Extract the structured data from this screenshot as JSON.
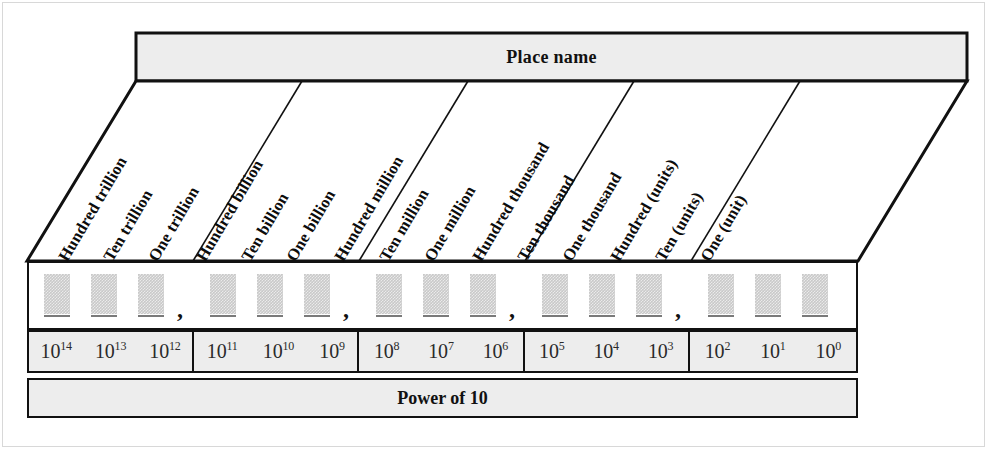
{
  "header": {
    "title": "Place name"
  },
  "footer": {
    "title": "Power of 10"
  },
  "colors": {
    "header_fill": "#ededed",
    "digit_box_fill": "#c9c9c9",
    "digit_underline": "#7a7a7a",
    "outline": "#111111",
    "page_background": "#ffffff"
  },
  "place_labels": [
    "Hundred trillion",
    "Ten trillion",
    "One trillion",
    "Hundred billion",
    "Ten billion",
    "One billion",
    "Hundred million",
    "Ten million",
    "One million",
    "Hundred thousand",
    "Ten thousand",
    "One thousand",
    "Hundred (units)",
    "Ten (units)",
    "One (unit)"
  ],
  "separator": ",",
  "digit_groups": [
    {
      "name": "trillions",
      "cells": [
        "",
        "",
        ""
      ]
    },
    {
      "name": "billions",
      "cells": [
        "",
        "",
        ""
      ]
    },
    {
      "name": "millions",
      "cells": [
        "",
        "",
        ""
      ]
    },
    {
      "name": "thousands",
      "cells": [
        "",
        "",
        ""
      ]
    },
    {
      "name": "units",
      "cells": [
        "",
        "",
        ""
      ]
    }
  ],
  "exponent_groups": [
    {
      "name": "trillions",
      "cells": [
        {
          "base": "10",
          "exp": "14"
        },
        {
          "base": "10",
          "exp": "13"
        },
        {
          "base": "10",
          "exp": "12"
        }
      ]
    },
    {
      "name": "billions",
      "cells": [
        {
          "base": "10",
          "exp": "11"
        },
        {
          "base": "10",
          "exp": "10"
        },
        {
          "base": "10",
          "exp": "9"
        }
      ]
    },
    {
      "name": "millions",
      "cells": [
        {
          "base": "10",
          "exp": "8"
        },
        {
          "base": "10",
          "exp": "7"
        },
        {
          "base": "10",
          "exp": "6"
        }
      ]
    },
    {
      "name": "thousands",
      "cells": [
        {
          "base": "10",
          "exp": "5"
        },
        {
          "base": "10",
          "exp": "4"
        },
        {
          "base": "10",
          "exp": "3"
        }
      ]
    },
    {
      "name": "units",
      "cells": [
        {
          "base": "10",
          "exp": "2"
        },
        {
          "base": "10",
          "exp": "1"
        },
        {
          "base": "10",
          "exp": "0"
        }
      ]
    }
  ]
}
